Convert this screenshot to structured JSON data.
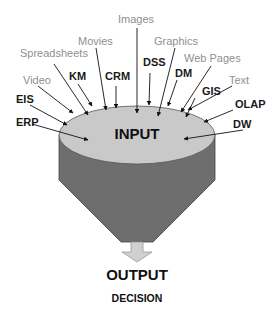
{
  "diagram": {
    "funnel_top_label": "INPUT",
    "output_label": "OUTPUT",
    "decision_label": "DECISION",
    "colors": {
      "funnel_top": "#c9c9c9",
      "funnel_body": "#6e6e6e",
      "arrow_fill": "#d0d0d0",
      "label_dark": "#1a1a1a",
      "label_grey": "#8f8f8f"
    },
    "inputs": [
      {
        "label": "Images",
        "style": "grey"
      },
      {
        "label": "Movies",
        "style": "grey"
      },
      {
        "label": "Graphics",
        "style": "grey"
      },
      {
        "label": "Spreadsheets",
        "style": "grey"
      },
      {
        "label": "Web Pages",
        "style": "grey"
      },
      {
        "label": "KM",
        "style": "dark"
      },
      {
        "label": "CRM",
        "style": "dark"
      },
      {
        "label": "DSS",
        "style": "dark"
      },
      {
        "label": "DM",
        "style": "dark"
      },
      {
        "label": "Video",
        "style": "grey"
      },
      {
        "label": "Text",
        "style": "grey"
      },
      {
        "label": "EIS",
        "style": "dark"
      },
      {
        "label": "GIS",
        "style": "dark"
      },
      {
        "label": "OLAP",
        "style": "dark"
      },
      {
        "label": "ERP",
        "style": "dark"
      },
      {
        "label": "DW",
        "style": "dark"
      }
    ]
  }
}
